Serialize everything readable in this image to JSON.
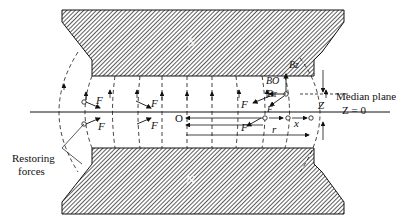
{
  "diagram": {
    "poles": {
      "top_label": "S",
      "bottom_label": "N"
    },
    "labels": {
      "force": "F",
      "origin": "O",
      "radius": "r",
      "displacement": "x",
      "vertical_offset": "Z",
      "b_z": "Bz",
      "b_o": "BO",
      "b_r": "Br",
      "median_plane": "Median plane",
      "z_zero": "Z = 0",
      "restoring_forces_line1": "Restoring",
      "restoring_forces_line2": "forces"
    },
    "colors": {
      "pole_fill": "#8a8a8a",
      "line": "#111111",
      "background": "#ffffff"
    }
  }
}
